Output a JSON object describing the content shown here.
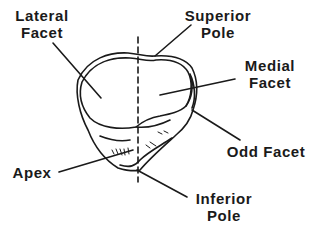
{
  "diagram": {
    "line_color": "#1a1a1a",
    "background": "#ffffff",
    "labels": {
      "lateral_facet": {
        "line1": "Lateral",
        "line2": "Facet"
      },
      "superior_pole": {
        "line1": "Superior",
        "line2": "Pole"
      },
      "medial_facet": {
        "line1": "Medial",
        "line2": "Facet"
      },
      "odd_facet": {
        "line1": "Odd Facet"
      },
      "apex": {
        "line1": "Apex"
      },
      "inferior_pole": {
        "line1": "Inferior",
        "line2": "Pole"
      }
    }
  }
}
